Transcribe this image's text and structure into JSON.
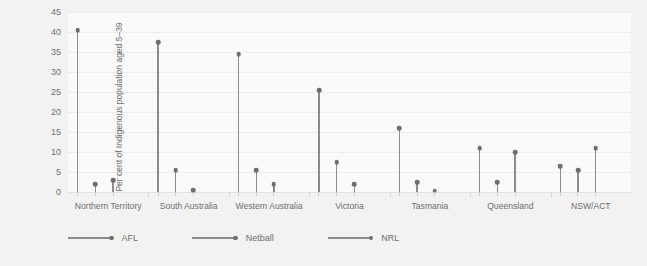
{
  "chart_data": {
    "type": "line",
    "title": "",
    "subtitle": "",
    "xlabel": "",
    "ylabel": "Per cent of Indigenous population aged 5–39",
    "ylim": [
      0,
      45
    ],
    "ytick_labels": [
      "0",
      "5",
      "10",
      "15",
      "20",
      "25",
      "30",
      "35",
      "40",
      "45"
    ],
    "ytick_values": [
      0,
      5,
      10,
      15,
      20,
      25,
      30,
      35,
      40,
      45
    ],
    "grid": true,
    "legend_position": "bottom-left",
    "categories": [
      "Northern Territory",
      "South Australia",
      "Western Australia",
      "Victoria",
      "Tasmania",
      "Queensland",
      "NSW/ACT"
    ],
    "series": [
      {
        "name": "AFL",
        "values": [
          40.5,
          37.5,
          34.5,
          25.5,
          16.0,
          11.0,
          6.5
        ]
      },
      {
        "name": "Netball",
        "values": [
          2.0,
          5.5,
          5.5,
          7.5,
          2.5,
          2.5,
          5.5
        ]
      },
      {
        "name": "NRL",
        "values": [
          3.0,
          0.5,
          2.0,
          2.0,
          0.3,
          10.0,
          11.0
        ]
      }
    ]
  },
  "legend": {
    "items": [
      {
        "label": "AFL"
      },
      {
        "label": "Netball"
      },
      {
        "label": "NRL"
      }
    ]
  }
}
